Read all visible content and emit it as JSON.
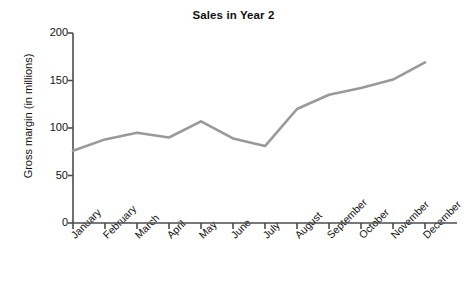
{
  "chart_data": {
    "type": "line",
    "title": "Sales in Year 2",
    "xlabel": "",
    "ylabel": "Gross margin (in millions)",
    "categories": [
      "January",
      "February",
      "March",
      "April",
      "May",
      "June",
      "July",
      "August",
      "September",
      "October",
      "November",
      "December"
    ],
    "values": [
      76,
      88,
      95,
      90,
      107,
      89,
      81,
      120,
      135,
      142,
      151,
      169
    ],
    "series": [
      {
        "name": "Gross margin",
        "values": [
          76,
          88,
          95,
          90,
          107,
          89,
          81,
          120,
          135,
          142,
          151,
          169
        ],
        "color": "#999999"
      }
    ],
    "ylim": [
      0,
      200
    ],
    "yticks": [
      0,
      50,
      100,
      150,
      200
    ],
    "ytick_labels": [
      "0",
      "50",
      "100",
      "150",
      "200"
    ],
    "grid": false,
    "legend": false,
    "legend_position": "none",
    "line_color": "#999999",
    "axis_color": "#4d4d4d",
    "markers": false,
    "xtick_rotation": -45
  }
}
